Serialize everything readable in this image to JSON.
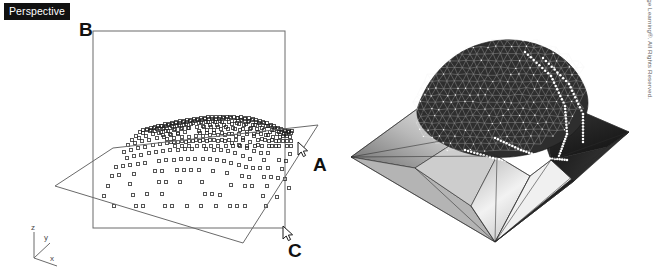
{
  "figure": {
    "background_color": "#ffffff",
    "ink_color": "#111111",
    "line_color": "#555555"
  },
  "left_panel": {
    "viewport_badge": "Perspective",
    "labels": {
      "b": "B",
      "a": "A",
      "c": "C"
    },
    "axis_triad": {
      "z": "z",
      "y": "y",
      "x": "x"
    },
    "point_cloud": {
      "marker": "open-square",
      "marker_size_px": 3,
      "point_count": 392,
      "description": "Elevation point cloud forming a ridge/dome surface"
    },
    "cutting_plane": {
      "name": "vertical-section-plane",
      "corner_label": "B",
      "rect": {
        "x": 93,
        "y": 31,
        "width": 192,
        "height": 197
      }
    },
    "oblique_plane": {
      "name": "oblique-clip-plane",
      "vertices": "(55,186) (113,148) (318,125) (243,243)"
    },
    "cursors": [
      {
        "name": "cursor-a",
        "x": 298,
        "y": 142,
        "label": "A"
      },
      {
        "name": "cursor-c",
        "x": 283,
        "y": 226,
        "label": "C"
      }
    ]
  },
  "right_panel": {
    "render_name": "shaded-tin-surface",
    "description": "Triangulated irregular network surface with hill-shading, white vertex nodes along ridge lines",
    "shading": {
      "light_face": "#e8e8e8",
      "mid_face": "#9a9a9a",
      "dark_face": "#1e1e1e",
      "mesh_line": "#202020",
      "vertex_node": "#ffffff"
    }
  },
  "copyright": "© 2014 Cengage Learning®. All Rights Reserved.",
  "bottom_caption": ""
}
